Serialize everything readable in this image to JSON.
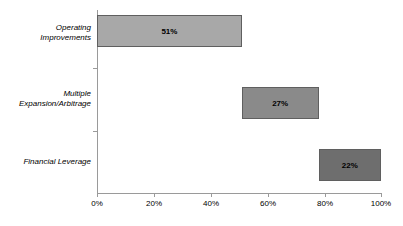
{
  "chart_data": {
    "type": "bar",
    "orientation": "horizontal",
    "subtype": "waterfall",
    "title": "",
    "subtitle": "",
    "xlabel": "",
    "ylabel": "",
    "xlim": [
      0,
      100
    ],
    "grid": false,
    "legend": null,
    "categories": [
      "Operating Improvements",
      "Multiple Expansion/Arbitrage",
      "Financial Leverage"
    ],
    "values": [
      51,
      27,
      22
    ],
    "data_labels": [
      "51%",
      "27%",
      "22%"
    ],
    "bar_starts": [
      0,
      51,
      78
    ],
    "bar_ends": [
      51,
      78,
      100
    ],
    "bar_colors": [
      "#a8a8a8",
      "#8a8a8a",
      "#6e6e6e"
    ],
    "xticks": [
      0,
      20,
      40,
      60,
      80,
      100
    ],
    "xtick_labels": [
      "0%",
      "20%",
      "40%",
      "60%",
      "80%",
      "100%"
    ],
    "bars": [
      {
        "category_line_1": "Operating",
        "category_line_2": "Improvements",
        "label": "51%",
        "start": 0,
        "end": 51,
        "value": 51,
        "color": "#a8a8a8"
      },
      {
        "category_line_1": "Multiple",
        "category_line_2": "Expansion/Arbitrage",
        "label": "27%",
        "start": 51,
        "end": 78,
        "value": 27,
        "color": "#8a8a8a"
      },
      {
        "category_line_1": "Financial Leverage",
        "category_line_2": "",
        "label": "22%",
        "start": 78,
        "end": 100,
        "value": 22,
        "color": "#6e6e6e"
      }
    ],
    "axis_color": "#9a9a9a",
    "bar_border_color": "#5f5f5f",
    "background": "#ffffff"
  }
}
